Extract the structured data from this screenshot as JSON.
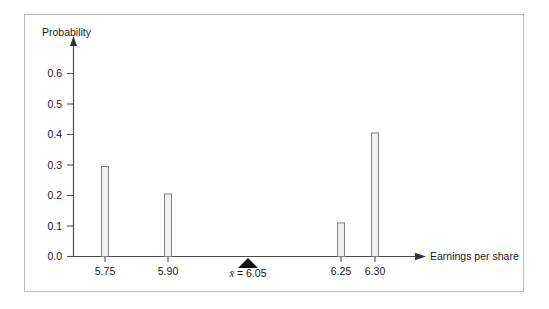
{
  "chart_data": {
    "type": "bar",
    "title": "",
    "subtitle": "",
    "xlabel": "Earnings per share",
    "ylabel": "Probability",
    "categories": [
      "5.75",
      "5.90",
      "6.25",
      "6.30"
    ],
    "values": [
      0.295,
      0.205,
      0.11,
      0.405
    ],
    "series": [
      {
        "name": "Probability",
        "values": [
          0.295,
          0.205,
          0.11,
          0.405
        ]
      }
    ],
    "x": [
      5.75,
      5.9,
      6.25,
      6.3
    ],
    "ylim": [
      0.0,
      0.65
    ],
    "ytick_labels": [
      "0.0",
      "0.1",
      "0.2",
      "0.3",
      "0.4",
      "0.5",
      "0.6"
    ],
    "ytick_values": [
      0.0,
      0.1,
      0.2,
      0.3,
      0.4,
      0.5,
      0.6
    ],
    "xtick_labels": [
      "5.75",
      "5.90",
      "6.25",
      "6.30"
    ],
    "grid": false,
    "legend": false,
    "legend_position": "none",
    "annotations": [
      {
        "name": "mean-marker",
        "symbol": "x̄",
        "equals": " = ",
        "value": "6.05",
        "text": "x̄ = 6.05",
        "x": 6.05
      }
    ],
    "colors": {
      "bar_fill": "#f0f0f0",
      "bar_edge": "#808080",
      "axis": "#4d4d4d",
      "text": "#1a1a1a",
      "frame": "#b9b9b9",
      "marker": "#111111",
      "background": "#ffffff"
    }
  },
  "axes": {
    "y_title": "Probability",
    "x_title": "Earnings per share"
  }
}
